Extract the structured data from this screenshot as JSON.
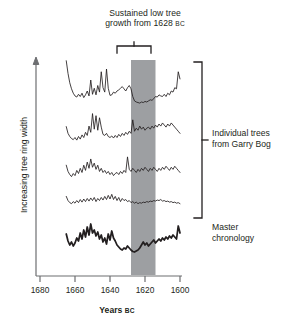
{
  "annotation": {
    "title_line1": "Sustained low tree",
    "title_line2_pre": "growth from 1628 ",
    "title_line2_era": "BC",
    "bracket_name": "event-bracket"
  },
  "legend": {
    "trees_line1": "Individual trees",
    "trees_line2": "from Garry Bog",
    "master_line1": "Master",
    "master_line2": "chronology"
  },
  "axes": {
    "y_title": "Increasing tree ring width",
    "x_title_main": "Years ",
    "x_title_era": "BC",
    "x_ticks": [
      "1680",
      "1660",
      "1640",
      "1620",
      "1600"
    ],
    "x_tick_values": [
      1680,
      1660,
      1640,
      1620,
      1600
    ],
    "x_min": 1680,
    "x_max": 1600,
    "x_direction": "decreasing-left-to-right"
  },
  "colors": {
    "ink": "#231f20",
    "axis": "#6d6e71",
    "band": "#9d9fa2",
    "trace": "#231f20",
    "background": "#ffffff"
  },
  "highlight_band": {
    "label": "sustained-low-growth-band",
    "start_year": 1628,
    "end_year": 1614,
    "fill": "#9d9fa2"
  },
  "chart_data": {
    "type": "line",
    "title": "Sustained low tree growth from 1628 BC",
    "xlabel": "Years BC",
    "ylabel": "Increasing tree ring width",
    "xlim": [
      1680,
      1600
    ],
    "grid": false,
    "legend_position": "right",
    "x_ticks": [
      1680,
      1660,
      1640,
      1620,
      1600
    ],
    "annotations": [
      {
        "text": "Sustained low tree growth from 1628 BC",
        "year": 1621,
        "type": "bracket-label"
      },
      {
        "text": "Individual trees from Garry Bog",
        "type": "group-bracket",
        "series": [
          "tree-1",
          "tree-2",
          "tree-3",
          "tree-4"
        ]
      },
      {
        "text": "Master chronology",
        "type": "series-label",
        "series": [
          "master"
        ]
      }
    ],
    "series": [
      {
        "name": "tree-1",
        "label": "Individual tree 1",
        "style": "thin",
        "x": [
          1665,
          1664,
          1663,
          1662,
          1661,
          1660,
          1659,
          1658,
          1657,
          1656,
          1655,
          1654,
          1653,
          1652,
          1651,
          1650,
          1649,
          1648,
          1647,
          1646,
          1645,
          1644,
          1643,
          1642,
          1641,
          1640,
          1639,
          1638,
          1637,
          1636,
          1635,
          1634,
          1633,
          1632,
          1631,
          1630,
          1629,
          1628,
          1627,
          1626,
          1625,
          1624,
          1623,
          1622,
          1621,
          1620,
          1619,
          1618,
          1617,
          1616,
          1615,
          1614,
          1613,
          1612,
          1611,
          1610,
          1609,
          1608,
          1607,
          1606,
          1605,
          1604,
          1603,
          1602,
          1601,
          1600
        ],
        "values": [
          95,
          72,
          55,
          44,
          36,
          31,
          29,
          34,
          30,
          36,
          28,
          33,
          40,
          31,
          60,
          34,
          45,
          33,
          50,
          38,
          75,
          46,
          38,
          80,
          45,
          32,
          33,
          38,
          36,
          40,
          42,
          45,
          48,
          44,
          40,
          46,
          50,
          44,
          30,
          22,
          20,
          19,
          18,
          20,
          19,
          21,
          20,
          22,
          24,
          23,
          26,
          30,
          29,
          33,
          31,
          30,
          34,
          30,
          36,
          33,
          40,
          38,
          46,
          44,
          75,
          62
        ]
      },
      {
        "name": "tree-2",
        "label": "Individual tree 2",
        "style": "thin",
        "x": [
          1665,
          1664,
          1663,
          1662,
          1661,
          1660,
          1659,
          1658,
          1657,
          1656,
          1655,
          1654,
          1653,
          1652,
          1651,
          1650,
          1649,
          1648,
          1647,
          1646,
          1645,
          1644,
          1643,
          1642,
          1641,
          1640,
          1639,
          1638,
          1637,
          1636,
          1635,
          1634,
          1633,
          1632,
          1631,
          1630,
          1629,
          1628,
          1627,
          1626,
          1625,
          1624,
          1623,
          1622,
          1621,
          1620,
          1619,
          1618,
          1617,
          1616,
          1615,
          1614,
          1613,
          1612,
          1611,
          1610,
          1609,
          1608,
          1607,
          1606,
          1605,
          1604,
          1603,
          1602,
          1601,
          1600
        ],
        "values": [
          45,
          32,
          26,
          22,
          20,
          24,
          19,
          26,
          21,
          29,
          24,
          34,
          28,
          46,
          34,
          70,
          40,
          66,
          38,
          62,
          44,
          30,
          28,
          32,
          26,
          24,
          27,
          23,
          28,
          24,
          30,
          26,
          32,
          28,
          34,
          30,
          36,
          32,
          58,
          36,
          42,
          38,
          46,
          40,
          44,
          38,
          42,
          44,
          40,
          46,
          42,
          48,
          44,
          50,
          46,
          52,
          48,
          44,
          50,
          46,
          52,
          48,
          44,
          40,
          36,
          32
        ]
      },
      {
        "name": "tree-3",
        "label": "Individual tree 3",
        "style": "thin",
        "x": [
          1665,
          1664,
          1663,
          1662,
          1661,
          1660,
          1659,
          1658,
          1657,
          1656,
          1655,
          1654,
          1653,
          1652,
          1651,
          1650,
          1649,
          1648,
          1647,
          1646,
          1645,
          1644,
          1643,
          1642,
          1641,
          1640,
          1639,
          1638,
          1637,
          1636,
          1635,
          1634,
          1633,
          1632,
          1631,
          1630,
          1629,
          1628,
          1627,
          1626,
          1625,
          1624,
          1623,
          1622,
          1621,
          1620,
          1619,
          1618,
          1617,
          1616,
          1615,
          1614,
          1613,
          1612,
          1611,
          1610,
          1609,
          1608,
          1607,
          1606,
          1605,
          1604,
          1603,
          1602,
          1601,
          1600
        ],
        "values": [
          40,
          28,
          22,
          18,
          24,
          20,
          30,
          24,
          34,
          26,
          40,
          30,
          46,
          34,
          52,
          36,
          44,
          32,
          40,
          28,
          34,
          26,
          30,
          24,
          28,
          22,
          26,
          20,
          24,
          26,
          22,
          28,
          24,
          30,
          26,
          56,
          32,
          28,
          34,
          30,
          26,
          32,
          28,
          34,
          30,
          36,
          32,
          28,
          34,
          30,
          36,
          32,
          28,
          34,
          30,
          36,
          32,
          38,
          34,
          30,
          36,
          32,
          38,
          34,
          30,
          26
        ]
      },
      {
        "name": "tree-4",
        "label": "Individual tree 4",
        "style": "thin",
        "x": [
          1665,
          1664,
          1663,
          1662,
          1661,
          1660,
          1659,
          1658,
          1657,
          1656,
          1655,
          1654,
          1653,
          1652,
          1651,
          1650,
          1649,
          1648,
          1647,
          1646,
          1645,
          1644,
          1643,
          1642,
          1641,
          1640,
          1639,
          1638,
          1637,
          1636,
          1635,
          1634,
          1633,
          1632,
          1631,
          1630,
          1629,
          1628,
          1627,
          1626,
          1625,
          1624,
          1623,
          1622,
          1621,
          1620,
          1619,
          1618,
          1617,
          1616,
          1615,
          1614,
          1613,
          1612,
          1611,
          1610,
          1609,
          1608,
          1607,
          1606,
          1605,
          1604,
          1603,
          1602,
          1601,
          1600
        ],
        "values": [
          30,
          22,
          18,
          16,
          20,
          17,
          22,
          18,
          24,
          19,
          25,
          20,
          26,
          21,
          27,
          22,
          28,
          20,
          26,
          22,
          28,
          23,
          30,
          24,
          32,
          25,
          34,
          24,
          30,
          22,
          28,
          20,
          26,
          22,
          24,
          20,
          22,
          18,
          20,
          17,
          19,
          16,
          18,
          17,
          19,
          18,
          20,
          19,
          21,
          20,
          22,
          21,
          23,
          22,
          24,
          21,
          22,
          20,
          21,
          19,
          20,
          18,
          19,
          17,
          18,
          16
        ]
      },
      {
        "name": "master",
        "label": "Master chronology",
        "style": "thick",
        "x": [
          1665,
          1664,
          1663,
          1662,
          1661,
          1660,
          1659,
          1658,
          1657,
          1656,
          1655,
          1654,
          1653,
          1652,
          1651,
          1650,
          1649,
          1648,
          1647,
          1646,
          1645,
          1644,
          1643,
          1642,
          1641,
          1640,
          1639,
          1638,
          1637,
          1636,
          1635,
          1634,
          1633,
          1632,
          1631,
          1630,
          1629,
          1628,
          1627,
          1626,
          1625,
          1624,
          1623,
          1622,
          1621,
          1620,
          1619,
          1618,
          1617,
          1616,
          1615,
          1614,
          1613,
          1612,
          1611,
          1610,
          1609,
          1608,
          1607,
          1606,
          1605,
          1604,
          1603,
          1602,
          1601,
          1600
        ],
        "values": [
          52,
          38,
          30,
          36,
          28,
          34,
          44,
          38,
          54,
          42,
          60,
          46,
          66,
          50,
          72,
          54,
          60,
          48,
          56,
          42,
          50,
          36,
          44,
          32,
          52,
          40,
          58,
          44,
          38,
          30,
          26,
          22,
          20,
          24,
          22,
          28,
          24,
          20,
          17,
          16,
          18,
          20,
          24,
          30,
          36,
          30,
          34,
          28,
          32,
          36,
          40,
          34,
          38,
          42,
          38,
          44,
          40,
          46,
          42,
          48,
          44,
          50,
          46,
          42,
          68,
          54
        ]
      }
    ]
  }
}
